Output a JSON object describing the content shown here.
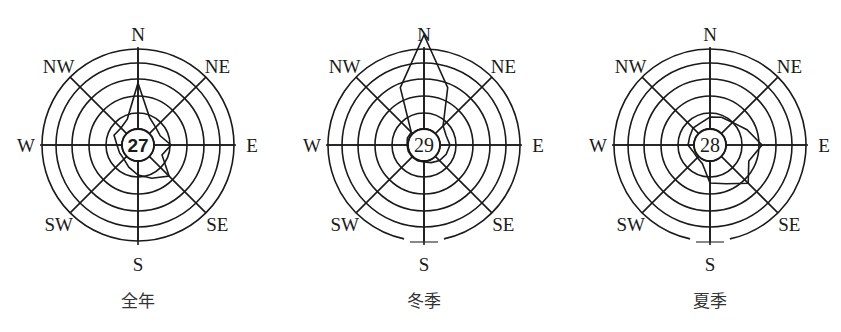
{
  "chart_data": [
    {
      "type": "wind-rose",
      "title": "全年",
      "calm": "27",
      "calm_bold": true,
      "center": [
        138,
        145
      ],
      "rings": [
        16,
        32,
        49,
        66,
        82,
        96
      ],
      "directions": [
        "N",
        "NNE",
        "NE",
        "ENE",
        "E",
        "ESE",
        "SE",
        "SSE",
        "S",
        "SSW",
        "SW",
        "WSW",
        "W",
        "WNW",
        "NW",
        "NNW"
      ],
      "labels": [
        "N",
        "NE",
        "E",
        "SE",
        "S",
        "SW",
        "W",
        "NW"
      ],
      "values_px": [
        62,
        30,
        25,
        24,
        33,
        26,
        44,
        36,
        30,
        24,
        20,
        20,
        21,
        26,
        24,
        28
      ],
      "s_gap": false
    },
    {
      "type": "wind-rose",
      "title": "冬季",
      "calm": "29",
      "calm_bold": false,
      "center": [
        424,
        145
      ],
      "rings": [
        16,
        32,
        49,
        66,
        82,
        96
      ],
      "directions": [
        "N",
        "NNE",
        "NE",
        "ENE",
        "E",
        "ESE",
        "SE",
        "SSE",
        "S",
        "SSW",
        "SW",
        "WSW",
        "W",
        "WNW",
        "NW",
        "NNW"
      ],
      "labels": [
        "N",
        "NE",
        "E",
        "SE",
        "S",
        "SW",
        "W",
        "NW"
      ],
      "values_px": [
        110,
        62,
        27,
        24,
        26,
        24,
        22,
        19,
        17,
        17,
        17,
        17,
        17,
        18,
        18,
        62
      ],
      "s_gap": true
    },
    {
      "type": "wind-rose",
      "title": "夏季",
      "calm": "28",
      "calm_bold": false,
      "center": [
        710,
        145
      ],
      "rings": [
        16,
        32,
        49,
        66,
        82,
        96
      ],
      "directions": [
        "N",
        "NNE",
        "NE",
        "ENE",
        "E",
        "ESE",
        "SE",
        "SSE",
        "S",
        "SSW",
        "SW",
        "WSW",
        "W",
        "WNW",
        "NW",
        "NNW"
      ],
      "labels": [
        "N",
        "NE",
        "E",
        "SE",
        "S",
        "SW",
        "W",
        "NW"
      ],
      "values_px": [
        28,
        30,
        32,
        40,
        52,
        42,
        54,
        42,
        38,
        20,
        18,
        18,
        22,
        22,
        24,
        24
      ],
      "s_gap": true
    }
  ]
}
